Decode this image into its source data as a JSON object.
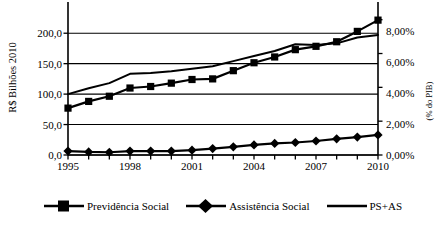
{
  "chart_data": {
    "type": "line",
    "title": "",
    "subtitle": "",
    "xlabel": "",
    "ylabel": "R$ Bilhões 2010",
    "y2label": "(% do PIB)",
    "x": [
      1995,
      1996,
      1997,
      1998,
      1999,
      2000,
      2001,
      2002,
      2003,
      2004,
      2005,
      2006,
      2007,
      2008,
      2009,
      2010
    ],
    "xtick_labels": [
      "1995",
      "1998",
      "2001",
      "2004",
      "2007",
      "2010"
    ],
    "xtick_values": [
      1995,
      1998,
      2001,
      2004,
      2007,
      2010
    ],
    "xlim": [
      1995,
      2010
    ],
    "ylim": [
      0,
      225
    ],
    "ytick_labels": [
      "0,0",
      "50,0",
      "100,0",
      "150,0",
      "200,0"
    ],
    "ytick_values": [
      0,
      50,
      100,
      150,
      200
    ],
    "y2lim": [
      0,
      8.1
    ],
    "y2tick_labels": [
      "0,00%",
      "2,00%",
      "4,00%",
      "6,00%",
      "8,00%"
    ],
    "y2tick_values": [
      0,
      2,
      4,
      6,
      8
    ],
    "grid": true,
    "grid_axis": "y",
    "legend_position": "bottom",
    "series": [
      {
        "name": "Previdência Social",
        "axis": "left",
        "marker": "square",
        "values": [
          77.0,
          88.0,
          96.5,
          110.0,
          112.5,
          118.0,
          124.0,
          125.0,
          138.5,
          151.5,
          161.0,
          173.0,
          178.5,
          186.0,
          203.0,
          221.5
        ]
      },
      {
        "name": "Assistência Social",
        "axis": "left",
        "marker": "diamond",
        "values": [
          6.5,
          5.0,
          4.5,
          6.5,
          6.5,
          6.5,
          8.0,
          10.5,
          13.5,
          16.5,
          19.0,
          20.5,
          23.0,
          26.5,
          29.5,
          33.0
        ]
      },
      {
        "name": "PS+AS",
        "axis": "right",
        "marker": "none",
        "values": [
          3.6,
          3.95,
          4.25,
          4.8,
          4.85,
          4.95,
          5.1,
          5.25,
          5.55,
          5.85,
          6.15,
          6.55,
          6.5,
          6.6,
          6.95,
          7.1
        ]
      }
    ]
  },
  "legend": {
    "items": [
      {
        "label": "Previdência Social",
        "marker": "square"
      },
      {
        "label": "Assistência Social",
        "marker": "diamond"
      },
      {
        "label": "PS+AS",
        "marker": "line"
      }
    ]
  },
  "colors": {
    "series": "#000000",
    "grid": "#000000",
    "axis": "#000000",
    "background": "#ffffff"
  }
}
